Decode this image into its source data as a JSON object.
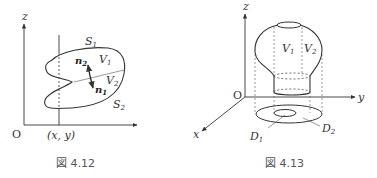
{
  "figures": [
    {
      "caption": "図 4.12",
      "axis_labels": {
        "z": "z",
        "origin": "O",
        "point": "(x, y)"
      },
      "surface_labels": {
        "upper": "S",
        "upper_sub": "1",
        "lower": "S",
        "lower_sub": "2"
      },
      "region_labels": {
        "upper": "V",
        "upper_sub": "1",
        "lower": "V",
        "lower_sub": "2"
      },
      "normal_labels": {
        "upper": "n",
        "upper_sub": "2",
        "lower": "n",
        "lower_sub": "1"
      }
    },
    {
      "caption": "図 4.13",
      "axis_labels": {
        "z": "z",
        "y": "y",
        "x": "x",
        "origin": "O"
      },
      "region_labels": {
        "left": "V",
        "left_sub": "1",
        "right": "V",
        "right_sub": "2"
      },
      "domain_labels": {
        "inner": "D",
        "inner_sub": "1",
        "outer": "D",
        "outer_sub": "2"
      }
    }
  ],
  "colors": {
    "stroke": "#333333",
    "text": "#333333",
    "caption": "#555555"
  }
}
